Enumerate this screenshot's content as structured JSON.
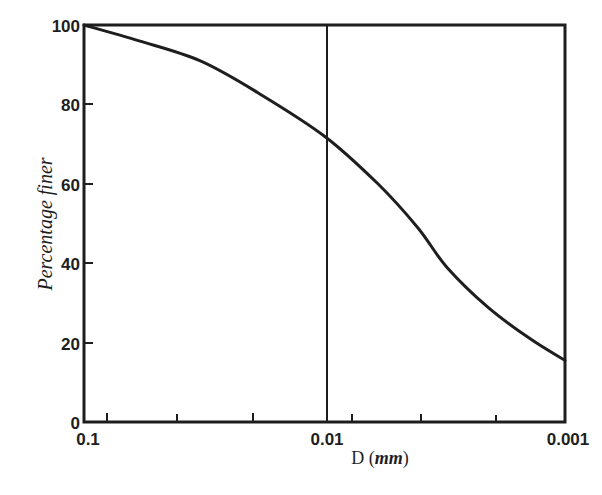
{
  "chart_data": {
    "type": "line",
    "title": "",
    "xlabel": "D (mm)",
    "ylabel": "Percentage finer",
    "x_scale": "log",
    "x_direction": "decreasing",
    "xlim": [
      0.1,
      0.001
    ],
    "ylim": [
      0,
      100
    ],
    "x_tick_labels": [
      "0.1",
      "0.01",
      "0.001"
    ],
    "y_tick_labels": [
      "0",
      "20",
      "40",
      "60",
      "80",
      "100"
    ],
    "grid": false,
    "legend": null,
    "reference_lines": [
      {
        "axis": "x",
        "value": 0.01
      }
    ],
    "series": [
      {
        "name": "grain size distribution",
        "x": [
          0.1,
          0.059,
          0.033,
          0.019,
          0.01,
          0.006,
          0.0041,
          0.0031,
          0.0021,
          0.0014,
          0.001
        ],
        "y": [
          100,
          96,
          91,
          83,
          72,
          60,
          49,
          39,
          29,
          21,
          15.5
        ]
      }
    ]
  },
  "labels": {
    "x_axis_main": "D",
    "x_axis_unit": "mm",
    "y_axis": "Percentage finer",
    "x_ticks": [
      "0.1",
      "0.01",
      "0.001"
    ],
    "y_ticks": [
      "0",
      "20",
      "40",
      "60",
      "80",
      "100"
    ]
  },
  "colors": {
    "ink": "#1e1e1e",
    "background": "#ffffff"
  }
}
